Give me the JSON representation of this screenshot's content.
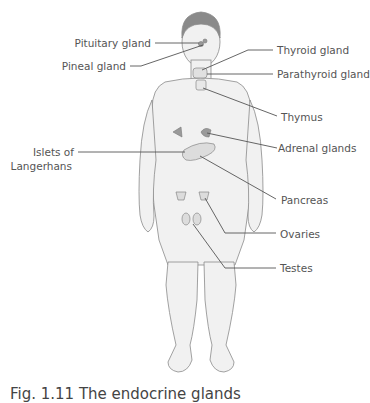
{
  "labels": {
    "pituitary": "Pituitary gland",
    "pineal": "Pineal gland",
    "thyroid": "Thyroid gland",
    "parathyroid": "Parathyroid gland",
    "thymus": "Thymus",
    "islets_line1": "Islets of",
    "islets_line2": "Langerhans",
    "adrenal": "Adrenal glands",
    "pancreas": "Pancreas",
    "ovaries": "Ovaries",
    "testes": "Testes"
  },
  "caption": "Fig. 1.11 The endocrine glands",
  "colors": {
    "body_fill": "#f0f0f0",
    "body_stroke": "#8a8a8a",
    "gland_fill": "#9a9a9a",
    "leader_line": "#555555",
    "label_text": "#555555"
  }
}
